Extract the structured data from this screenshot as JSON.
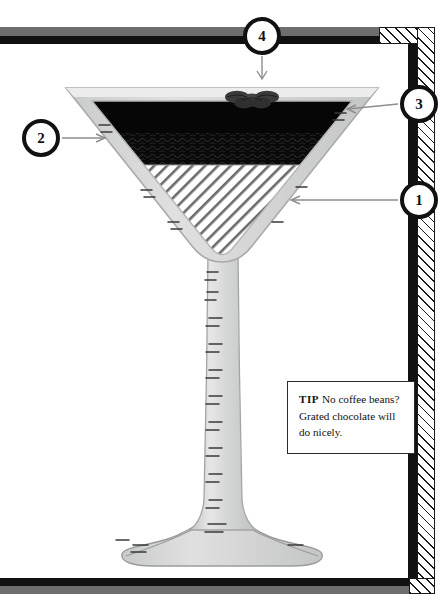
{
  "illustration": {
    "title": "Martini glass layered cocktail diagram",
    "subject": "espresso-martini-glass"
  },
  "callouts": [
    {
      "id": "1",
      "label": "1",
      "arrow": "left",
      "target": "glass-bowl-lower-liquid"
    },
    {
      "id": "2",
      "label": "2",
      "arrow": "right",
      "target": "glass-bowl-left-rim"
    },
    {
      "id": "3",
      "label": "3",
      "arrow": "left",
      "target": "glass-bowl-upper-foam"
    },
    {
      "id": "4",
      "label": "4",
      "arrow": "down",
      "target": "coffee-beans-garnish"
    }
  ],
  "tip": {
    "label": "TIP",
    "text": "No coffee beans? Grated chocolate will do nicely."
  },
  "glass": {
    "foam_layer": "dark-crema-top",
    "liquid_layer": "textured-dark-band",
    "base_layer": "diagonal-hatched-lower",
    "garnish": "three-coffee-beans",
    "parts": [
      "bowl",
      "stem",
      "foot"
    ]
  },
  "colors": {
    "frame_black": "#111111",
    "frame_gray": "#6e6e6e",
    "glass_body": "#d2d4d3",
    "glass_rim": "#e2e3e2",
    "liquid_dark": "#070707",
    "bean_gray": "#3a3a3a",
    "arrow_gray": "#8a8a8a",
    "paper_white": "#ffffff"
  }
}
